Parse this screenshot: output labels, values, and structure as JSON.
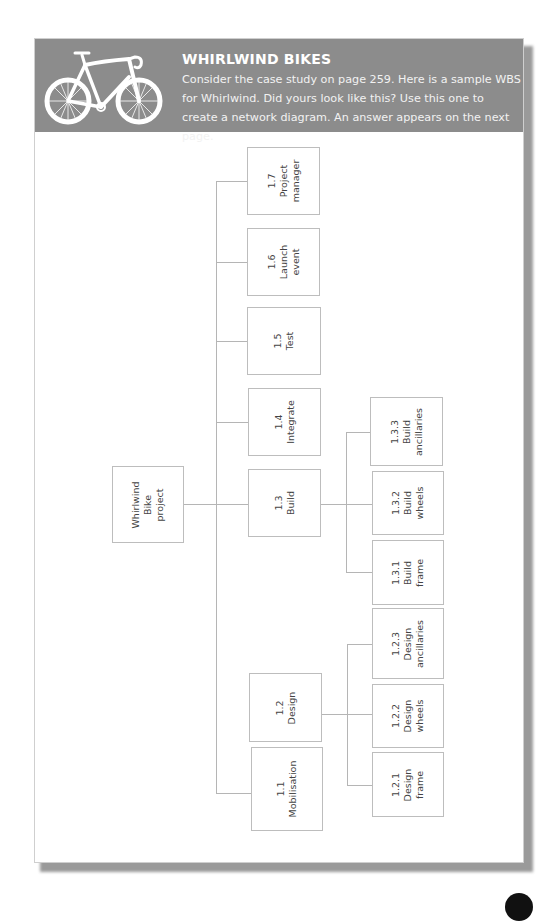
{
  "header": {
    "title": "WHIRLWIND BIKES",
    "description": "Consider the case study on page 259. Here is a sample WBS for Whirlwind. Did yours look like this? Use this one to create a network diagram. An answer appears on the next page.",
    "icon": "bicycle-icon",
    "background_color": "#8c8c8c"
  },
  "wbs": {
    "root": {
      "id": "root",
      "lines": [
        "Whirlwind",
        "Bike",
        "project"
      ]
    },
    "level1": [
      {
        "id": "1.7",
        "lines": [
          "1.7",
          "Project",
          "manager"
        ]
      },
      {
        "id": "1.6",
        "lines": [
          "1.6",
          "Launch",
          "event"
        ]
      },
      {
        "id": "1.5",
        "lines": [
          "1.5",
          "Test"
        ]
      },
      {
        "id": "1.4",
        "lines": [
          "1.4",
          "Integrate"
        ]
      },
      {
        "id": "1.3",
        "lines": [
          "1.3",
          "Build"
        ]
      },
      {
        "id": "1.2",
        "lines": [
          "1.2",
          "Design"
        ]
      },
      {
        "id": "1.1",
        "lines": [
          "1.1",
          "Mobilisation"
        ]
      }
    ],
    "build_children": [
      {
        "id": "1.3.3",
        "lines": [
          "1.3.3",
          "Build",
          "ancillaries"
        ]
      },
      {
        "id": "1.3.2",
        "lines": [
          "1.3.2",
          "Build",
          "wheels"
        ]
      },
      {
        "id": "1.3.1",
        "lines": [
          "1.3.1",
          "Build",
          "frame"
        ]
      }
    ],
    "design_children": [
      {
        "id": "1.2.3",
        "lines": [
          "1.2.3",
          "Design",
          "ancillaries"
        ]
      },
      {
        "id": "1.2.2",
        "lines": [
          "1.2.2",
          "Design",
          "wheels"
        ]
      },
      {
        "id": "1.2.1",
        "lines": [
          "1.2.1",
          "Design",
          "frame"
        ]
      }
    ]
  }
}
